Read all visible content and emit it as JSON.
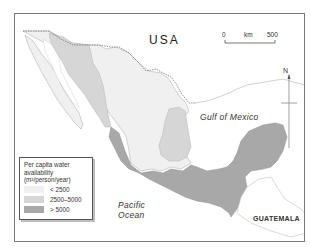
{
  "map": {
    "labels": {
      "country_north": "USA",
      "gulf": "Gulf of Mexico",
      "ocean_line1": "Pacific",
      "ocean_line2": "Ocean",
      "country_south": "GUATEMALA"
    },
    "scale_bar": {
      "start": "0",
      "unit": "km",
      "end": "500"
    },
    "north_arrow": {
      "label": "N"
    },
    "legend": {
      "title_line1": "Per capita water",
      "title_line2": "availability",
      "title_line3": "(m³/person/year)",
      "items": [
        {
          "label": "< 2500",
          "color": "#f0f0f0"
        },
        {
          "label": "2500–5000",
          "color": "#d6d6d6"
        },
        {
          "label": "> 5000",
          "color": "#a8a8a8"
        }
      ]
    },
    "colors": {
      "low": "#f0f0f0",
      "medium": "#d6d6d6",
      "high": "#a8a8a8",
      "outline": "#9a9a9a",
      "frame": "#7a7a7a"
    }
  }
}
